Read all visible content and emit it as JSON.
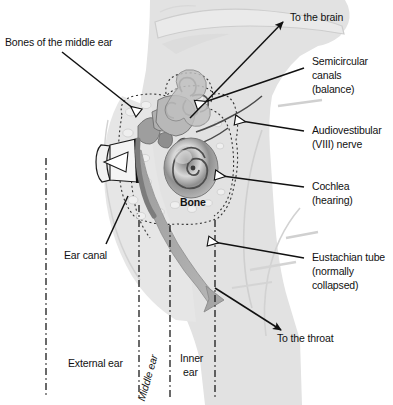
{
  "figure": {
    "type": "labeled-anatomical-diagram",
    "background_color": "#ffffff",
    "head_silhouette_color": "#dcdcdc",
    "structure_color": "#9a9a9a",
    "line_color": "#1a1a1a"
  },
  "labels": {
    "bones_middle_ear": "Bones of the middle ear",
    "ear_canal": "Ear canal",
    "to_the_brain": "To the brain",
    "semicircular_line1": "Semicircular",
    "semicircular_line2": "canals",
    "semicircular_line3": "(balance)",
    "nerve_line1": "Audiovestibular",
    "nerve_line2": "(VIII) nerve",
    "cochlea_line1": "Cochlea",
    "cochlea_line2": "(hearing)",
    "eustachian_line1": "Eustachian tube",
    "eustachian_line2": "(normally",
    "eustachian_line3": "collapsed)",
    "to_the_throat": "To the throat",
    "bone": "Bone",
    "external_ear": "External ear",
    "middle_ear": "Middle ear",
    "inner_ear_line1": "Inner",
    "inner_ear_line2": "ear"
  },
  "regions": [
    {
      "name": "External ear",
      "divider_x": [
        46,
        139
      ]
    },
    {
      "name": "Middle ear",
      "divider_x": [
        139,
        170
      ]
    },
    {
      "name": "Inner ear",
      "divider_x": [
        170,
        215
      ]
    }
  ],
  "callouts": [
    {
      "name": "bones-of-the-middle-ear",
      "arrowhead": "hollow",
      "points_to": "ossicles"
    },
    {
      "name": "ear-canal",
      "arrowhead": "none",
      "points_to": "external-auditory-canal"
    },
    {
      "name": "to-the-brain",
      "arrowhead": "solid",
      "points_to": "brain-direction"
    },
    {
      "name": "semicircular-canals",
      "arrowhead": "hollow",
      "points_to": "semicircular-canals"
    },
    {
      "name": "audiovestibular-nerve",
      "arrowhead": "hollow",
      "points_to": "vestibulocochlear-nerve"
    },
    {
      "name": "cochlea",
      "arrowhead": "hollow",
      "points_to": "cochlea"
    },
    {
      "name": "eustachian-tube",
      "arrowhead": "hollow",
      "points_to": "eustachian-tube"
    },
    {
      "name": "to-the-throat",
      "arrowhead": "solid",
      "points_to": "throat-direction"
    }
  ]
}
